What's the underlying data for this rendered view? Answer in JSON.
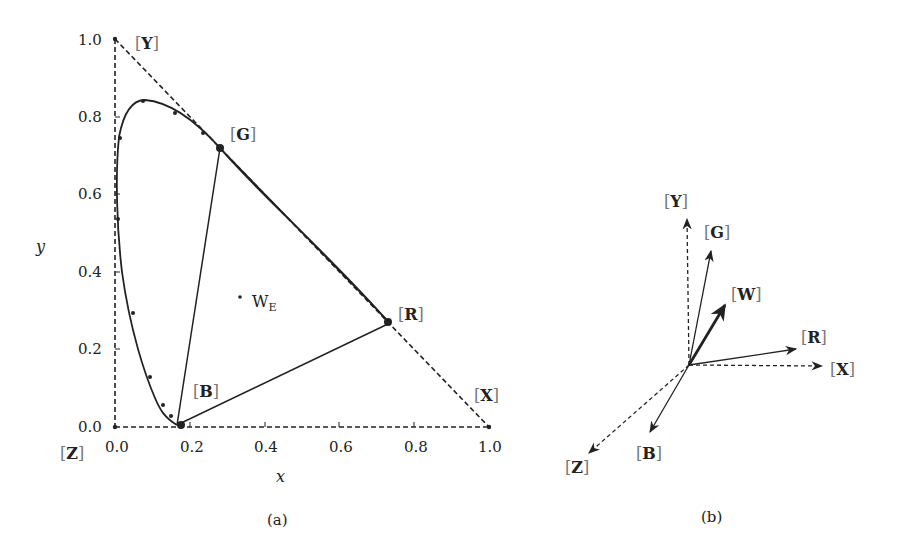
{
  "panel_a": {
    "caption": "(a)",
    "x_axis_title": "x",
    "y_axis_title": "y",
    "x_ticks": [
      "0.0",
      "0.2",
      "0.4",
      "0.6",
      "0.8",
      "1.0"
    ],
    "y_ticks": [
      "0.0",
      "0.2",
      "0.4",
      "0.6",
      "0.8",
      "1.0"
    ],
    "labels": {
      "Y": "Y",
      "G": "G",
      "R": "R",
      "B": "B",
      "X": "X",
      "Z": "Z",
      "W_main": "W",
      "W_sub": "E"
    },
    "primaries": {
      "Y": [
        0.0,
        1.0
      ],
      "X": [
        1.0,
        0.0
      ],
      "Z": [
        0.0,
        0.0
      ],
      "G": [
        0.28,
        0.72
      ],
      "R": [
        0.735,
        0.265
      ],
      "B": [
        0.167,
        0.009
      ],
      "W_E": [
        0.333,
        0.333
      ]
    }
  },
  "panel_b": {
    "caption": "(b)",
    "vectors": [
      {
        "name": "Y",
        "label": "Y",
        "style": "dashed"
      },
      {
        "name": "G",
        "label": "G",
        "style": "solid"
      },
      {
        "name": "W",
        "label": "W",
        "style": "bold"
      },
      {
        "name": "R",
        "label": "R",
        "style": "solid"
      },
      {
        "name": "X",
        "label": "X",
        "style": "dashed"
      },
      {
        "name": "B",
        "label": "B",
        "style": "solid"
      },
      {
        "name": "Z",
        "label": "Z",
        "style": "dashed"
      }
    ]
  },
  "colors": {
    "ink": "#222222",
    "bracket": "#777777",
    "background": "#ffffff"
  }
}
